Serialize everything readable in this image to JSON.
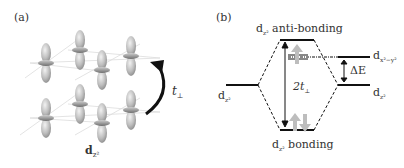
{
  "figure": {
    "panel_a": {
      "label": "(a)",
      "orbital_label": "d",
      "orbital_sub": "z²",
      "hopping_label": "t",
      "hopping_sub": "⊥"
    },
    "panel_b": {
      "label": "(b)",
      "antibonding_label": "d",
      "antibonding_sub": "z²",
      "antibonding_text": " anti-bonding",
      "bonding_label": "d",
      "bonding_sub": "z²",
      "bonding_text": " bonding",
      "left_level_label": "d",
      "left_level_sub": "z²",
      "right_upper_label": "d",
      "right_upper_sub": "x²−y²",
      "right_lower_label": "d",
      "right_lower_sub": "z²",
      "splitting_label": "2t",
      "splitting_sub": "⊥",
      "delta_label": "ΔE"
    }
  }
}
